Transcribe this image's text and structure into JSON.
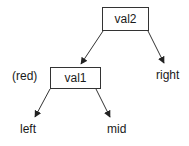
{
  "diagram": {
    "type": "tree",
    "nodes": [
      {
        "id": "val2",
        "label": "val2",
        "kind": "box"
      },
      {
        "id": "val1",
        "label": "val1",
        "kind": "box",
        "annotation": "(red)"
      }
    ],
    "leaves": [
      {
        "id": "right",
        "label": "right"
      },
      {
        "id": "left",
        "label": "left"
      },
      {
        "id": "mid",
        "label": "mid"
      }
    ],
    "edges": [
      {
        "from": "val2",
        "to": "val1"
      },
      {
        "from": "val2",
        "to": "right"
      },
      {
        "from": "val1",
        "to": "left"
      },
      {
        "from": "val1",
        "to": "mid"
      }
    ],
    "colors": {
      "stroke": "#333333",
      "text": "#1a1a1a",
      "background": "#ffffff"
    }
  }
}
